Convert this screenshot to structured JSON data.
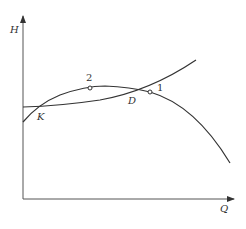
{
  "diagram": {
    "type": "pump-system-characteristic-curves",
    "axes": {
      "y_label": "H",
      "x_label": "Q"
    },
    "curves": [
      {
        "name": "pump-curve",
        "shape": "concave-down"
      },
      {
        "name": "system-curve",
        "shape": "concave-up"
      }
    ],
    "points": [
      {
        "id": "K",
        "label": "K",
        "description": "left intersection of curves"
      },
      {
        "id": "D",
        "label": "D",
        "description": "right intersection of curves"
      },
      {
        "id": "1",
        "label": "1",
        "description": "marked point on pump curve right of D"
      },
      {
        "id": "2",
        "label": "2",
        "description": "marked point near pump curve peak"
      }
    ],
    "colors": {
      "line": "#333333",
      "background": "#ffffff"
    }
  }
}
